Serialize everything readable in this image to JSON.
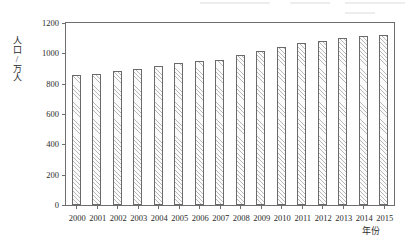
{
  "chart_data": {
    "type": "bar",
    "title": "",
    "xlabel": "年份",
    "ylabel": "人口/万人",
    "categories": [
      "2000",
      "2001",
      "2002",
      "2003",
      "2004",
      "2005",
      "2006",
      "2007",
      "2008",
      "2009",
      "2010",
      "2011",
      "2012",
      "2013",
      "2014",
      "2015"
    ],
    "values": [
      855,
      867,
      883,
      898,
      917,
      938,
      950,
      958,
      992,
      1015,
      1045,
      1068,
      1083,
      1103,
      1113,
      1120
    ],
    "ylim": [
      0,
      1200
    ],
    "yticks": [
      0,
      200,
      400,
      600,
      800,
      1000,
      1200
    ],
    "ytick_labels": [
      "0",
      "200",
      "400",
      "600",
      "800",
      "1000",
      "1200"
    ],
    "grid": false,
    "legend": null,
    "bar_fill": "#fbfbfb",
    "bar_hatch": "diagonal",
    "bar_edge_color": "#6a6a6a",
    "axis_color": "#6e6e6e",
    "background": "#ffffff"
  },
  "axes": {
    "y_title": "人口/万人",
    "x_title": "年份"
  }
}
